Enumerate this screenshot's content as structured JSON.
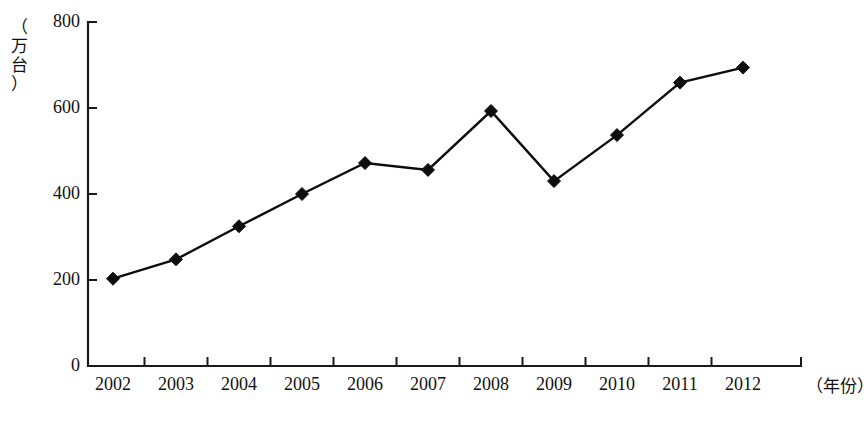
{
  "chart_data": {
    "type": "line",
    "title": "",
    "subtitle": "",
    "xlabel": "（年份）",
    "ylabel": "（万台）",
    "ylabel_chars": [
      "（",
      "万",
      "台",
      "）"
    ],
    "categories": [
      "2002",
      "2003",
      "2004",
      "2005",
      "2006",
      "2007",
      "2008",
      "2009",
      "2010",
      "2011",
      "2012"
    ],
    "values": [
      203,
      248,
      325,
      400,
      472,
      456,
      593,
      430,
      537,
      659,
      694
    ],
    "series": [
      {
        "name": "",
        "values": [
          203,
          248,
          325,
          400,
          472,
          456,
          593,
          430,
          537,
          659,
          694
        ]
      }
    ],
    "ylim": [
      0,
      800
    ],
    "y_ticks": [
      0,
      200,
      400,
      600,
      800
    ],
    "y_tick_labels": [
      "0",
      "200",
      "400",
      "600",
      "800"
    ],
    "grid": false,
    "legend": false,
    "legend_position": "none",
    "marker": "diamond",
    "line_color": "#0d0d0d",
    "marker_color": "#0d0d0d",
    "axis_color": "#1a1a1a",
    "background_color": "#ffffff"
  }
}
